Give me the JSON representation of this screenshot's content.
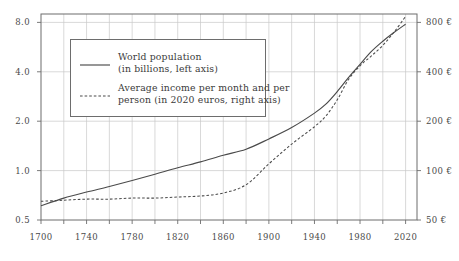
{
  "chart_data": {
    "type": "line",
    "title": "",
    "subtitle": "",
    "xlabel": "",
    "ylabel": "",
    "grid": true,
    "legend_position": "upper-left-inside",
    "x_scale": "linear",
    "x_range": [
      1700,
      2030
    ],
    "x_ticks": [
      1700,
      1740,
      1780,
      1820,
      1860,
      1900,
      1940,
      1980,
      2020
    ],
    "x_tick_labels": [
      "1700",
      "1740",
      "1780",
      "1820",
      "1860",
      "1900",
      "1940",
      "1980",
      "2020"
    ],
    "x_minor_ticks": [
      1720,
      1760,
      1800,
      1840,
      1880,
      1920,
      1960,
      2000
    ],
    "left_axis": {
      "scale": "log",
      "range": [
        0.5,
        9.0
      ],
      "ticks": [
        0.5,
        1.0,
        2.0,
        4.0,
        8.0
      ],
      "tick_labels": [
        "0.5",
        "1.0",
        "2.0",
        "4.0",
        "8.0"
      ],
      "unit": "billions"
    },
    "right_axis": {
      "scale": "log",
      "range": [
        50,
        900
      ],
      "ticks": [
        50,
        100,
        200,
        400,
        800
      ],
      "tick_labels": [
        "50 €",
        "100 €",
        "200 €",
        "400 €",
        "800 €"
      ],
      "unit": "2020 euros per month per person"
    },
    "series": [
      {
        "name": "World population",
        "legend_label_line1": "World population",
        "legend_label_line2": "(in billions, left axis)",
        "style": "solid",
        "color": "#4a4a4a",
        "axis": "left",
        "x": [
          1700,
          1720,
          1740,
          1760,
          1780,
          1800,
          1820,
          1840,
          1860,
          1880,
          1900,
          1920,
          1940,
          1950,
          1960,
          1970,
          1980,
          1990,
          2000,
          2010,
          2020
        ],
        "values": [
          0.61,
          0.68,
          0.74,
          0.8,
          0.87,
          0.95,
          1.04,
          1.13,
          1.24,
          1.35,
          1.56,
          1.83,
          2.24,
          2.54,
          3.03,
          3.7,
          4.44,
          5.32,
          6.14,
          6.96,
          7.8
        ]
      },
      {
        "name": "Average income per month and per person",
        "legend_label_line1": "Average income per month and per",
        "legend_label_line2": "person (in 2020 euros, right axis)",
        "style": "dashed",
        "color": "#4a4a4a",
        "axis": "right",
        "x": [
          1700,
          1720,
          1740,
          1760,
          1780,
          1800,
          1820,
          1840,
          1860,
          1880,
          1900,
          1920,
          1940,
          1950,
          1960,
          1970,
          1980,
          1990,
          2000,
          2010,
          2020
        ],
        "values": [
          65,
          66,
          67,
          67,
          68,
          68,
          69,
          70,
          73,
          82,
          110,
          145,
          185,
          215,
          270,
          360,
          435,
          500,
          580,
          700,
          870
        ]
      }
    ],
    "annotations": []
  }
}
